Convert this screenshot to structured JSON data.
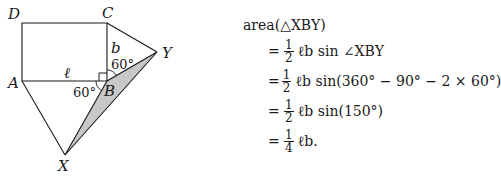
{
  "figure": {
    "vertices": {
      "A": {
        "label": "A",
        "x": 22,
        "y": 81
      },
      "B": {
        "label": "B",
        "x": 107,
        "y": 81
      },
      "C": {
        "label": "C",
        "x": 107,
        "y": 23
      },
      "D": {
        "label": "D",
        "x": 22,
        "y": 23
      },
      "X": {
        "label": "X",
        "x": 65,
        "y": 155
      },
      "Y": {
        "label": "Y",
        "x": 157,
        "y": 52
      }
    },
    "side_labels": {
      "AB": "ℓ",
      "BC": "b"
    },
    "angle_labels": {
      "CBY": "60°",
      "ABX": "60°"
    },
    "shaded_triangle": "XBY",
    "colors": {
      "stroke": "#1a1a1a",
      "shade": "#c8c8c8"
    }
  },
  "equations": {
    "head": "area(△XBY)",
    "rows": [
      {
        "sign": "=",
        "num": "1",
        "den": "2",
        "expr": "ℓb sin ∠XBY"
      },
      {
        "sign": "=",
        "num": "1",
        "den": "2",
        "expr": "ℓb sin(360° − 90° − 2 × 60°)"
      },
      {
        "sign": "=",
        "num": "1",
        "den": "2",
        "expr": "ℓb sin(150°)"
      },
      {
        "sign": "=",
        "num": "1",
        "den": "4",
        "expr": "ℓb."
      }
    ]
  }
}
